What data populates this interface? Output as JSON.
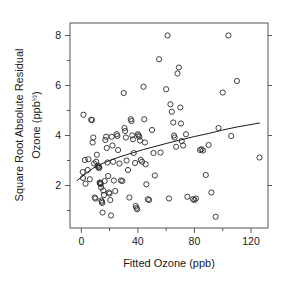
{
  "chart_data": {
    "type": "scatter",
    "title": "",
    "xlabel": "Fitted Ozone (ppb)",
    "ylabel_line1": "Square Root Absolute Residual",
    "ylabel_line2_pre": "Ozone (ppb",
    "ylabel_line2_sup": "½",
    "ylabel_line2_post": ")",
    "ylabel_full": "Square Root Absolute Residual Ozone (ppb½)",
    "xlim": [
      -8,
      132
    ],
    "ylim": [
      0.3,
      8.5
    ],
    "xticks": [
      0,
      40,
      80,
      120
    ],
    "xtick_labels": [
      "0",
      "40",
      "80",
      "120"
    ],
    "xminor_ticks": [
      20,
      60,
      100
    ],
    "yticks": [
      2,
      4,
      6,
      8
    ],
    "ytick_labels": [
      "2",
      "4",
      "6",
      "8"
    ],
    "yminor_ticks": [
      1,
      3,
      5,
      7
    ],
    "grid": false,
    "legend": null,
    "marker": "open-circle",
    "marker_color": "#2b2b2b",
    "marker_radius": 2.6,
    "line_color": "#1a1a1a",
    "frame_color": "#555555",
    "points": [
      [
        1.5,
        4.83
      ],
      [
        1.0,
        2.54
      ],
      [
        1.2,
        2.3
      ],
      [
        2.5,
        3.02
      ],
      [
        3.0,
        2.07
      ],
      [
        4.5,
        2.62
      ],
      [
        5.0,
        3.05
      ],
      [
        6.0,
        2.25
      ],
      [
        7.0,
        4.63
      ],
      [
        7.5,
        4.62
      ],
      [
        8.0,
        3.72
      ],
      [
        8.5,
        3.92
      ],
      [
        9.0,
        2.88
      ],
      [
        9.5,
        1.52
      ],
      [
        10.0,
        1.48
      ],
      [
        10.5,
        2.95
      ],
      [
        11.0,
        3.23
      ],
      [
        11.5,
        2.8
      ],
      [
        12.0,
        2.72
      ],
      [
        12.5,
        2.76
      ],
      [
        12.8,
        2.7
      ],
      [
        13.0,
        2.12
      ],
      [
        13.2,
        2.08
      ],
      [
        13.5,
        2.1
      ],
      [
        13.8,
        2.05
      ],
      [
        14.0,
        1.92
      ],
      [
        14.2,
        1.4
      ],
      [
        14.5,
        1.35
      ],
      [
        14.8,
        1.3
      ],
      [
        15.0,
        0.92
      ],
      [
        15.5,
        1.8
      ],
      [
        16.0,
        1.62
      ],
      [
        16.5,
        2.18
      ],
      [
        17.0,
        3.82
      ],
      [
        17.5,
        3.95
      ],
      [
        18.0,
        3.5
      ],
      [
        18.5,
        2.92
      ],
      [
        19.0,
        2.38
      ],
      [
        19.5,
        1.72
      ],
      [
        20.0,
        1.68
      ],
      [
        20.5,
        1.42
      ],
      [
        21.0,
        0.8
      ],
      [
        21.5,
        3.95
      ],
      [
        22.0,
        3.6
      ],
      [
        22.5,
        2.95
      ],
      [
        23.0,
        2.2
      ],
      [
        24.0,
        1.78
      ],
      [
        25.0,
        4.05
      ],
      [
        25.5,
        3.98
      ],
      [
        26.0,
        3.42
      ],
      [
        27.0,
        2.88
      ],
      [
        28.0,
        2.2
      ],
      [
        29.0,
        2.18
      ],
      [
        30.0,
        5.7
      ],
      [
        30.5,
        4.3
      ],
      [
        31.0,
        4.18
      ],
      [
        31.5,
        3.92
      ],
      [
        32.0,
        3.0
      ],
      [
        33.0,
        2.62
      ],
      [
        34.0,
        1.52
      ],
      [
        35.0,
        4.65
      ],
      [
        35.5,
        4.58
      ],
      [
        36.0,
        4.0
      ],
      [
        36.5,
        3.85
      ],
      [
        37.0,
        3.3
      ],
      [
        38.0,
        2.9
      ],
      [
        38.5,
        1.18
      ],
      [
        39.0,
        1.1
      ],
      [
        39.5,
        1.05
      ],
      [
        40.0,
        4.05
      ],
      [
        40.5,
        4.0
      ],
      [
        41.0,
        3.95
      ],
      [
        41.5,
        3.8
      ],
      [
        42.0,
        3.02
      ],
      [
        43.0,
        2.95
      ],
      [
        44.0,
        5.95
      ],
      [
        44.5,
        4.65
      ],
      [
        45.0,
        3.72
      ],
      [
        45.5,
        2.85
      ],
      [
        46.0,
        2.05
      ],
      [
        47.0,
        1.45
      ],
      [
        48.0,
        1.42
      ],
      [
        50.0,
        4.22
      ],
      [
        51.0,
        3.3
      ],
      [
        52.0,
        2.4
      ],
      [
        55.0,
        7.05
      ],
      [
        56.0,
        3.32
      ],
      [
        60.0,
        5.85
      ],
      [
        61.0,
        8.0
      ],
      [
        62.0,
        1.48
      ],
      [
        63.0,
        5.25
      ],
      [
        64.0,
        4.95
      ],
      [
        65.0,
        4.52
      ],
      [
        65.5,
        4.0
      ],
      [
        66.0,
        3.92
      ],
      [
        67.0,
        3.55
      ],
      [
        68.0,
        6.48
      ],
      [
        69.0,
        6.72
      ],
      [
        70.0,
        5.12
      ],
      [
        70.5,
        4.48
      ],
      [
        71.0,
        3.78
      ],
      [
        72.0,
        3.6
      ],
      [
        74.0,
        4.05
      ],
      [
        75.0,
        1.55
      ],
      [
        79.0,
        1.45
      ],
      [
        80.0,
        1.42
      ],
      [
        81.0,
        1.48
      ],
      [
        84.0,
        3.42
      ],
      [
        85.0,
        3.45
      ],
      [
        86.0,
        3.4
      ],
      [
        88.0,
        2.42
      ],
      [
        90.0,
        3.62
      ],
      [
        92.0,
        1.72
      ],
      [
        95.0,
        0.75
      ],
      [
        97.0,
        4.3
      ],
      [
        100.0,
        5.72
      ],
      [
        104.0,
        8.0
      ],
      [
        106.0,
        3.98
      ],
      [
        110.0,
        6.18
      ],
      [
        126.0,
        3.12
      ]
    ],
    "smooth_curve": [
      [
        -3.0,
        2.2
      ],
      [
        2.0,
        2.42
      ],
      [
        8.0,
        2.68
      ],
      [
        14.0,
        2.86
      ],
      [
        20.0,
        3.0
      ],
      [
        28.0,
        3.16
      ],
      [
        36.0,
        3.3
      ],
      [
        44.0,
        3.44
      ],
      [
        52.0,
        3.56
      ],
      [
        60.0,
        3.68
      ],
      [
        70.0,
        3.82
      ],
      [
        80.0,
        3.96
      ],
      [
        90.0,
        4.08
      ],
      [
        100.0,
        4.22
      ],
      [
        110.0,
        4.34
      ],
      [
        120.0,
        4.44
      ],
      [
        126.0,
        4.5
      ]
    ]
  }
}
